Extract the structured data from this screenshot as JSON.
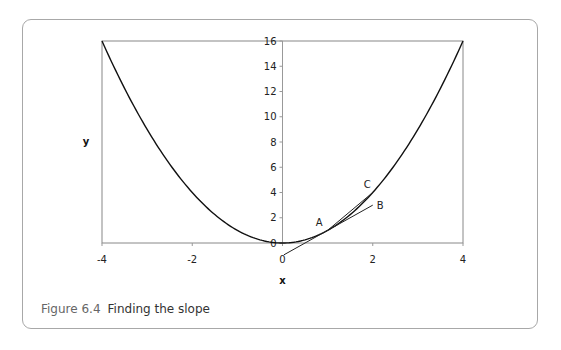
{
  "caption": {
    "number": "Figure 6.4",
    "title": "Finding the slope"
  },
  "chart_data": {
    "type": "line",
    "title": "Finding the slope",
    "xlabel": "x",
    "ylabel": "y",
    "xlim": [
      -4,
      4
    ],
    "ylim": [
      0,
      16
    ],
    "x_ticks": [
      "-4",
      "-2",
      "0",
      "2",
      "4"
    ],
    "y_ticks": [
      "0",
      "2",
      "4",
      "6",
      "8",
      "10",
      "12",
      "14",
      "16"
    ],
    "grid": false,
    "series": [
      {
        "name": "y = x^2",
        "x": [
          -4,
          -3,
          -2,
          -1,
          0,
          1,
          2,
          3,
          4
        ],
        "y": [
          16,
          9,
          4,
          1,
          0,
          1,
          4,
          9,
          16
        ]
      },
      {
        "name": "tangent at A",
        "x": [
          0.03,
          2
        ],
        "y": [
          -0.94,
          3
        ]
      },
      {
        "name": "chord A-C",
        "x": [
          1,
          2
        ],
        "y": [
          1,
          4
        ]
      }
    ],
    "annotations": [
      {
        "label": "A",
        "x": 1,
        "y": 1
      },
      {
        "label": "B",
        "x": 2,
        "y": 3
      },
      {
        "label": "C",
        "x": 2,
        "y": 4
      }
    ]
  }
}
